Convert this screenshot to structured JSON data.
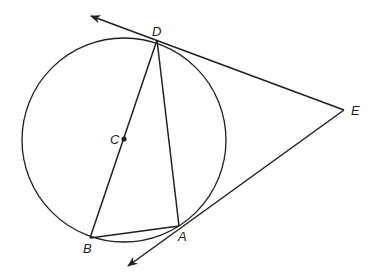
{
  "diagram": {
    "type": "geometry",
    "stroke_color": "#231f20",
    "circle": {
      "center_label": "C",
      "cx": 124,
      "cy": 140,
      "r": 102
    },
    "points": {
      "D": {
        "label": "D",
        "x": 157,
        "y": 40
      },
      "C": {
        "label": "C",
        "x": 124,
        "y": 139
      },
      "B": {
        "label": "B",
        "x": 90,
        "y": 238
      },
      "A": {
        "label": "A",
        "x": 179,
        "y": 226
      },
      "E": {
        "label": "E",
        "x": 344,
        "y": 110
      }
    },
    "segments": [
      "DB",
      "DA",
      "BA",
      "DE",
      "AE"
    ],
    "rays": [
      {
        "from": "E",
        "through": "D",
        "arrow_tip": [
          91,
          16
        ]
      },
      {
        "from": "E",
        "through": "A",
        "arrow_tip": [
          128,
          266
        ]
      }
    ]
  }
}
